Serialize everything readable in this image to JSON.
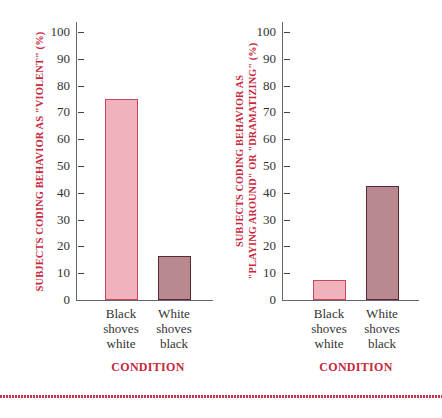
{
  "chart_data": [
    {
      "type": "bar",
      "title": "",
      "ylabel": "SUBJECTS CODING BEHAVIOR AS \"VIOLENT\" (%)",
      "xlabel": "CONDITION",
      "categories": [
        "Black shoves white",
        "White shoves black"
      ],
      "category_lines": [
        [
          "Black",
          "shoves",
          "white"
        ],
        [
          "White",
          "shoves",
          "black"
        ]
      ],
      "values": [
        75,
        16.5
      ],
      "colors": [
        "#f0b3bb",
        "#b98890"
      ],
      "ylim": [
        0,
        100
      ],
      "yticks": [
        0,
        10,
        20,
        30,
        40,
        50,
        60,
        70,
        80,
        90,
        100
      ],
      "grid": false
    },
    {
      "type": "bar",
      "title": "",
      "ylabel": "SUBJECTS CODING BEHAVIOR AS \"PLAYING AROUND\" OR \"DRAMATIZING\" (%)",
      "ylabel_lines": [
        "SUBJECTS CODING BEHAVIOR AS",
        "\"PLAYING AROUND\" OR \"DRAMATIZING\" (%)"
      ],
      "xlabel": "CONDITION",
      "categories": [
        "Black shoves white",
        "White shoves black"
      ],
      "category_lines": [
        [
          "Black",
          "shoves",
          "white"
        ],
        [
          "White",
          "shoves",
          "black"
        ]
      ],
      "values": [
        7.5,
        42.5
      ],
      "colors": [
        "#f0b3bb",
        "#b98890"
      ],
      "ylim": [
        0,
        100
      ],
      "yticks": [
        0,
        10,
        20,
        30,
        40,
        50,
        60,
        70,
        80,
        90,
        100
      ],
      "grid": false
    }
  ],
  "style": {
    "label_color": "#c8283c",
    "bar_light": "#f0b3bb",
    "bar_light_border": "#c8475a",
    "bar_dark": "#b98890",
    "bar_dark_border": "#5a2a33",
    "divider_color": "#c8344a"
  }
}
